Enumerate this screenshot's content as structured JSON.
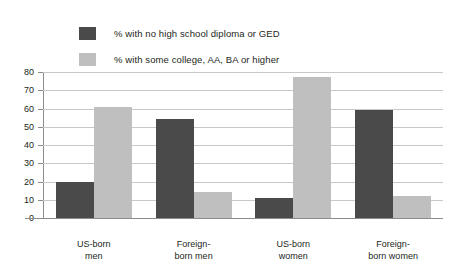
{
  "chart_data": {
    "type": "bar",
    "title": "",
    "xlabel": "",
    "ylabel": "",
    "ylim": [
      0,
      80
    ],
    "yticks": [
      80,
      70,
      60,
      50,
      40,
      30,
      20,
      10,
      0
    ],
    "grid": true,
    "legend_position": "above-left",
    "categories": [
      "US-born\nmen",
      "Foreign-\nborn men",
      "US-born\nwomen",
      "Foreign-\nborn women"
    ],
    "category_lines": [
      [
        "US-born",
        "men"
      ],
      [
        "Foreign-",
        "born men"
      ],
      [
        "US-born",
        "women"
      ],
      [
        "Foreign-",
        "born women"
      ]
    ],
    "series": [
      {
        "name": "% with no high school diploma or GED",
        "color": "#4a4a4a",
        "values": [
          20,
          54,
          11,
          59
        ]
      },
      {
        "name": "% with some college, AA, BA or higher",
        "color": "#bfbfbf",
        "values": [
          61,
          14,
          77,
          12
        ]
      }
    ]
  },
  "legend": {
    "items": [
      {
        "label": "% with no high school diploma or GED",
        "color": "#4a4a4a"
      },
      {
        "label": "% with some college, AA, BA or higher",
        "color": "#bfbfbf"
      }
    ]
  },
  "colors": {
    "background": "#ffffff",
    "axis": "#8c8c8c",
    "gridline": "#c8c8c8",
    "text": "#231f20"
  }
}
